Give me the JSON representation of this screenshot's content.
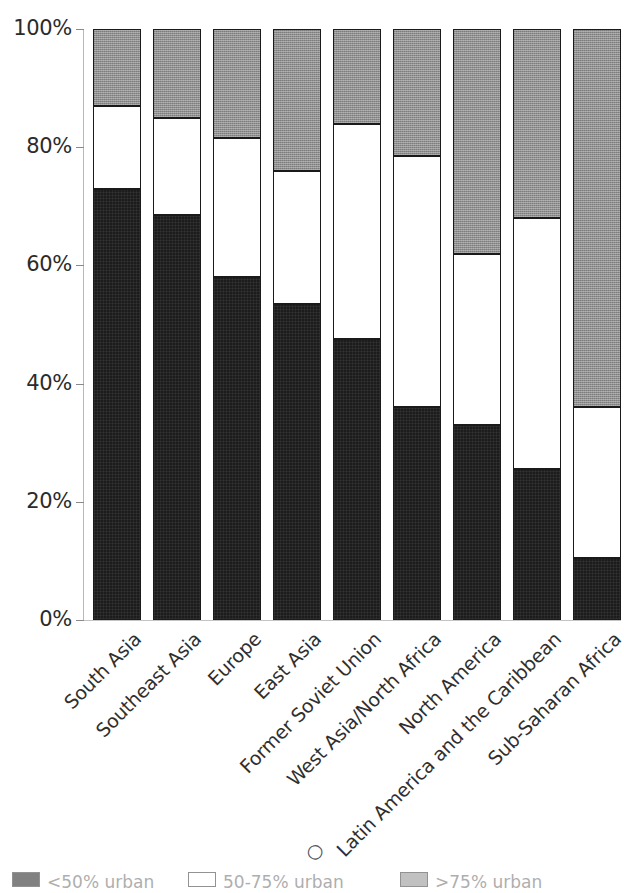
{
  "chart_data": {
    "type": "bar",
    "subtype": "stacked-100-percent",
    "title": "",
    "xlabel": "",
    "ylabel": "",
    "ylim": [
      0,
      100
    ],
    "ytick_labels": [
      "100%",
      "80%",
      "60%",
      "40%",
      "20%",
      "0%"
    ],
    "ytick_values": [
      100,
      80,
      60,
      40,
      20,
      0
    ],
    "grid": false,
    "legend_position": "bottom",
    "categories": [
      "South Asia",
      "Southeast Asia",
      "Europe",
      "East Asia",
      "Former Soviet Union",
      "West Asia/North Africa",
      "North America",
      "Latin America and the Caribbean",
      "Sub-Saharan Africa"
    ],
    "series": [
      {
        "name": "black",
        "color": "#1c1c1c",
        "values": [
          73,
          68.5,
          58,
          53.5,
          47.5,
          36,
          33,
          25.5,
          10.5
        ]
      },
      {
        "name": "white",
        "color": "#ffffff",
        "values": [
          14,
          16.5,
          23.5,
          22.5,
          36.5,
          42.5,
          29,
          42.5,
          25.5
        ]
      },
      {
        "name": "gray",
        "color": "#8f8f8f",
        "values": [
          13,
          15,
          18.5,
          24,
          16,
          21.5,
          38,
          32,
          64
        ]
      }
    ],
    "cumulative_tops": [
      {
        "category": "South Asia",
        "black_top": 73,
        "white_top": 87,
        "gray_top": 100
      },
      {
        "category": "Southeast Asia",
        "black_top": 68.5,
        "white_top": 85,
        "gray_top": 100
      },
      {
        "category": "Europe",
        "black_top": 58,
        "white_top": 81.5,
        "gray_top": 100
      },
      {
        "category": "East Asia",
        "black_top": 53.5,
        "white_top": 76,
        "gray_top": 100
      },
      {
        "category": "Former Soviet Union",
        "black_top": 47.5,
        "white_top": 84,
        "gray_top": 100
      },
      {
        "category": "West Asia/North Africa",
        "black_top": 36,
        "white_top": 78.5,
        "gray_top": 100
      },
      {
        "category": "North America",
        "black_top": 33,
        "white_top": 62,
        "gray_top": 100
      },
      {
        "category": "Latin America and the Caribbean",
        "black_top": 25.5,
        "white_top": 68,
        "gray_top": 100
      },
      {
        "category": "Sub-Saharan Africa",
        "black_top": 10.5,
        "white_top": 36,
        "gray_top": 100
      }
    ]
  },
  "axis": {
    "y_ticks": [
      {
        "label": "100%",
        "value": 100
      },
      {
        "label": "80%",
        "value": 80
      },
      {
        "label": "60%",
        "value": 60
      },
      {
        "label": "40%",
        "value": 40
      },
      {
        "label": "20%",
        "value": 20
      },
      {
        "label": "0%",
        "value": 0
      }
    ]
  },
  "legend": {
    "cropped": true,
    "items": [
      {
        "swatch": "black",
        "label": "<50% urban"
      },
      {
        "swatch": "white",
        "label": "50-75% urban"
      },
      {
        "swatch": "gray",
        "label": ">75% urban"
      }
    ]
  },
  "colors": {
    "black": "#1c1c1c",
    "white": "#ffffff",
    "gray": "#8f8f8f",
    "axis": "#b9b9b9",
    "text": "#2b2b2b"
  }
}
